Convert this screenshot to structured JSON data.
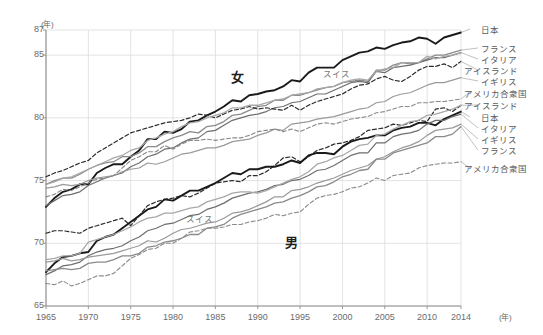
{
  "chart_data": {
    "type": "line",
    "title": "",
    "xlabel": "年",
    "ylabel": "年",
    "xlim": [
      1965,
      2014
    ],
    "ylim": [
      65,
      87
    ],
    "grid": true,
    "legend_position": "right",
    "x_ticks": [
      "1965",
      "1970",
      "1975",
      "1980",
      "1985",
      "1990",
      "1995",
      "2000",
      "2005",
      "2010",
      "2014"
    ],
    "y_ticks": [
      "87",
      "85",
      "80",
      "75",
      "70",
      "65"
    ],
    "x": [
      1965,
      1966,
      1967,
      1968,
      1969,
      1970,
      1971,
      1972,
      1973,
      1974,
      1975,
      1976,
      1977,
      1978,
      1979,
      1980,
      1981,
      1982,
      1983,
      1984,
      1985,
      1986,
      1987,
      1988,
      1989,
      1990,
      1991,
      1992,
      1993,
      1994,
      1995,
      1996,
      1997,
      1998,
      1999,
      2000,
      2001,
      2002,
      2003,
      2004,
      2005,
      2006,
      2007,
      2008,
      2009,
      2010,
      2011,
      2012,
      2013,
      2014
    ],
    "series": [
      {
        "name": "日本",
        "sex": "女",
        "style": "solid",
        "color": "#1a1a1a",
        "width": 1.9,
        "values": [
          72.9,
          73.6,
          74.1,
          74.3,
          74.7,
          74.7,
          75.6,
          76.0,
          76.3,
          76.3,
          76.9,
          77.4,
          78.3,
          78.3,
          78.9,
          78.8,
          79.1,
          79.7,
          79.8,
          80.2,
          80.5,
          80.9,
          81.4,
          81.3,
          81.8,
          81.9,
          82.1,
          82.2,
          82.5,
          83.0,
          82.9,
          83.6,
          84.0,
          84.0,
          84.0,
          84.6,
          84.9,
          85.2,
          85.3,
          85.6,
          85.5,
          85.8,
          86.0,
          86.1,
          86.4,
          86.3,
          85.9,
          86.4,
          86.6,
          86.8
        ]
      },
      {
        "name": "フランス",
        "sex": "女",
        "style": "solid",
        "color": "#8a8a8a",
        "width": 1.3,
        "values": [
          74.7,
          75.0,
          75.2,
          75.2,
          75.5,
          75.9,
          76.2,
          76.4,
          76.5,
          76.9,
          76.9,
          77.2,
          77.7,
          77.7,
          78.1,
          78.4,
          78.6,
          78.9,
          78.8,
          79.3,
          79.4,
          79.7,
          80.2,
          80.3,
          80.6,
          80.9,
          81.0,
          81.4,
          81.4,
          81.8,
          81.8,
          82.0,
          82.2,
          82.4,
          82.5,
          82.8,
          82.9,
          83.0,
          82.9,
          83.8,
          83.8,
          84.2,
          84.4,
          84.3,
          84.4,
          84.7,
          85.0,
          85.0,
          85.2,
          85.4
        ]
      },
      {
        "name": "イタリア",
        "sex": "女",
        "style": "solid",
        "color": "#6e6e6e",
        "width": 1.2,
        "values": [
          73.0,
          73.4,
          73.8,
          73.9,
          74.1,
          74.6,
          74.9,
          75.2,
          75.4,
          75.6,
          76.1,
          76.4,
          76.9,
          77.1,
          77.5,
          77.6,
          78.0,
          78.3,
          78.4,
          78.9,
          79.0,
          79.4,
          79.8,
          80.0,
          80.2,
          80.3,
          80.5,
          80.8,
          80.9,
          81.2,
          81.3,
          81.6,
          81.9,
          81.9,
          82.2,
          82.5,
          82.8,
          82.9,
          82.8,
          83.7,
          83.6,
          84.0,
          84.1,
          84.2,
          84.4,
          84.6,
          84.8,
          84.8,
          85.0,
          85.2
        ]
      },
      {
        "name": "アイスランド",
        "sex": "女",
        "style": "dashed",
        "color": "#2b2b2b",
        "width": 1.2,
        "values": [
          75.3,
          75.6,
          75.8,
          76.1,
          76.4,
          76.6,
          77.2,
          77.6,
          78.0,
          78.4,
          78.8,
          79.0,
          79.2,
          79.4,
          79.6,
          79.7,
          79.8,
          80.0,
          80.3,
          80.2,
          80.0,
          80.3,
          80.6,
          80.7,
          80.9,
          80.7,
          80.8,
          80.7,
          80.6,
          81.0,
          80.6,
          81.0,
          81.3,
          81.5,
          81.7,
          81.9,
          82.3,
          82.6,
          82.7,
          83.1,
          83.3,
          83.0,
          82.9,
          83.3,
          83.8,
          84.1,
          84.1,
          84.3,
          84.0,
          84.5
        ]
      },
      {
        "name": "イギリス",
        "sex": "女",
        "style": "solid",
        "color": "#9a9a9a",
        "width": 1.2,
        "values": [
          74.4,
          74.5,
          74.7,
          74.6,
          74.7,
          75.0,
          75.2,
          75.3,
          75.4,
          75.7,
          75.9,
          76.0,
          76.4,
          76.3,
          76.5,
          76.8,
          77.1,
          77.2,
          77.4,
          77.6,
          77.6,
          77.8,
          78.1,
          78.2,
          78.3,
          78.6,
          78.8,
          79.1,
          79.0,
          79.5,
          79.6,
          79.7,
          79.9,
          80.0,
          80.1,
          80.3,
          80.5,
          80.7,
          80.8,
          81.2,
          81.3,
          81.7,
          81.9,
          82.0,
          82.3,
          82.6,
          82.8,
          82.8,
          83.0,
          83.2
        ]
      },
      {
        "name": "アメリカ合衆国",
        "sex": "女",
        "style": "dashed",
        "color": "#8a8a8a",
        "width": 1.1,
        "values": [
          73.7,
          73.9,
          74.3,
          74.2,
          74.5,
          74.8,
          75.1,
          75.2,
          75.4,
          76.0,
          76.6,
          76.9,
          77.3,
          77.3,
          77.8,
          77.5,
          77.9,
          78.2,
          78.2,
          78.3,
          78.2,
          78.3,
          78.4,
          78.4,
          78.6,
          78.9,
          79.0,
          79.1,
          78.9,
          79.1,
          78.9,
          79.2,
          79.5,
          79.6,
          79.5,
          79.7,
          79.9,
          80.0,
          80.1,
          80.4,
          80.5,
          80.7,
          80.9,
          80.9,
          81.2,
          81.2,
          81.3,
          81.3,
          81.4,
          81.5
        ]
      },
      {
        "name": "スイス",
        "sex": "女",
        "style": "solid",
        "color": "#a8a8a8",
        "width": 1.3,
        "values": [
          74.7,
          74.9,
          75.2,
          75.3,
          75.6,
          75.9,
          76.2,
          76.5,
          76.8,
          77.0,
          77.4,
          77.6,
          78.2,
          78.4,
          78.7,
          78.9,
          79.3,
          79.6,
          79.7,
          80.0,
          80.2,
          80.4,
          80.8,
          80.8,
          81.0,
          81.0,
          81.2,
          81.4,
          81.5,
          81.8,
          81.9,
          82.0,
          82.3,
          82.4,
          82.5,
          82.8,
          83.0,
          83.1,
          83.0,
          83.7,
          83.9,
          84.0,
          84.4,
          84.4,
          84.4,
          84.9,
          84.7,
          84.9,
          85.0,
          85.2
        ]
      },
      {
        "name": "アイスランド",
        "sex": "男",
        "style": "dashed",
        "color": "#2b2b2b",
        "width": 1.2,
        "values": [
          70.8,
          71.0,
          71.0,
          70.9,
          70.8,
          71.2,
          71.4,
          71.6,
          71.8,
          72.0,
          71.4,
          72.2,
          73.0,
          73.3,
          73.5,
          73.6,
          73.8,
          73.7,
          74.0,
          74.4,
          74.8,
          74.9,
          75.0,
          74.9,
          75.4,
          75.4,
          75.7,
          76.2,
          76.8,
          76.9,
          76.5,
          76.9,
          77.4,
          77.6,
          77.9,
          78.0,
          78.2,
          78.5,
          79.0,
          79.1,
          79.2,
          79.5,
          79.4,
          79.6,
          79.8,
          79.7,
          80.7,
          80.8,
          80.5,
          81.0
        ]
      },
      {
        "name": "日本",
        "sex": "男",
        "style": "solid",
        "color": "#1a1a1a",
        "width": 1.9,
        "values": [
          67.7,
          68.4,
          68.9,
          69.0,
          69.2,
          69.3,
          70.2,
          70.5,
          70.7,
          71.2,
          71.7,
          72.2,
          72.7,
          72.9,
          73.5,
          73.4,
          73.8,
          74.2,
          74.2,
          74.5,
          74.8,
          75.2,
          75.6,
          75.5,
          75.9,
          75.9,
          76.1,
          76.1,
          76.3,
          76.6,
          76.4,
          77.0,
          77.2,
          77.2,
          77.1,
          77.7,
          78.1,
          78.3,
          78.4,
          78.6,
          78.6,
          79.0,
          79.2,
          79.3,
          79.6,
          79.6,
          79.4,
          79.9,
          80.2,
          80.5
        ]
      },
      {
        "name": "イタリア",
        "sex": "男",
        "style": "solid",
        "color": "#6e6e6e",
        "width": 1.2,
        "values": [
          67.5,
          67.8,
          68.2,
          68.3,
          68.5,
          69.0,
          69.3,
          69.5,
          69.6,
          69.8,
          70.2,
          70.5,
          71.0,
          71.2,
          71.5,
          71.6,
          71.9,
          72.2,
          72.3,
          72.7,
          72.9,
          73.2,
          73.6,
          73.8,
          74.0,
          74.1,
          74.3,
          74.6,
          74.7,
          75.0,
          75.1,
          75.4,
          75.8,
          75.9,
          76.2,
          76.6,
          77.0,
          77.2,
          77.2,
          78.0,
          78.0,
          78.5,
          78.7,
          78.8,
          79.0,
          79.5,
          79.8,
          79.8,
          80.1,
          80.3
        ]
      },
      {
        "name": "イギリス",
        "sex": "男",
        "style": "solid",
        "color": "#9a9a9a",
        "width": 1.2,
        "values": [
          68.5,
          68.6,
          68.8,
          68.6,
          68.7,
          68.9,
          69.0,
          69.1,
          69.2,
          69.4,
          69.6,
          69.8,
          70.2,
          70.1,
          70.4,
          70.8,
          71.1,
          71.2,
          71.4,
          71.6,
          71.7,
          72.0,
          72.4,
          72.5,
          72.7,
          73.0,
          73.3,
          73.7,
          73.7,
          74.2,
          74.3,
          74.5,
          74.8,
          75.0,
          75.2,
          75.5,
          75.8,
          76.0,
          76.2,
          76.7,
          76.9,
          77.3,
          77.6,
          77.8,
          78.1,
          78.6,
          79.0,
          79.1,
          79.2,
          79.5
        ]
      },
      {
        "name": "フランス",
        "sex": "男",
        "style": "solid",
        "color": "#8a8a8a",
        "width": 1.3,
        "values": [
          67.8,
          67.9,
          68.0,
          67.9,
          68.0,
          68.4,
          68.5,
          68.5,
          68.7,
          69.0,
          69.0,
          69.2,
          69.7,
          69.8,
          70.1,
          70.2,
          70.4,
          70.7,
          70.7,
          71.2,
          71.3,
          71.5,
          72.0,
          72.3,
          72.5,
          72.7,
          72.9,
          73.2,
          73.3,
          73.6,
          73.8,
          74.1,
          74.5,
          74.6,
          74.9,
          75.3,
          75.5,
          75.8,
          75.9,
          76.7,
          76.7,
          77.2,
          77.4,
          77.6,
          77.8,
          78.0,
          78.5,
          78.5,
          78.7,
          79.3
        ]
      },
      {
        "name": "アメリカ合衆国",
        "sex": "男",
        "style": "dashed",
        "color": "#8a8a8a",
        "width": 1.1,
        "values": [
          66.8,
          66.7,
          67.0,
          66.6,
          66.8,
          67.1,
          67.4,
          67.4,
          67.6,
          68.2,
          68.8,
          69.1,
          69.5,
          69.6,
          70.0,
          70.0,
          70.4,
          70.9,
          71.0,
          71.2,
          71.2,
          71.3,
          71.5,
          71.5,
          71.7,
          71.8,
          72.0,
          72.3,
          72.2,
          72.4,
          72.5,
          73.1,
          73.6,
          73.8,
          73.9,
          74.1,
          74.4,
          74.5,
          74.8,
          75.2,
          75.0,
          75.4,
          75.5,
          75.6,
          76.0,
          76.2,
          76.3,
          76.4,
          76.4,
          76.5
        ]
      },
      {
        "name": "スイス",
        "sex": "男",
        "style": "solid",
        "color": "#a8a8a8",
        "width": 1.3,
        "values": [
          68.7,
          68.8,
          69.0,
          69.0,
          69.2,
          70.1,
          70.3,
          70.5,
          70.7,
          71.0,
          71.3,
          71.7,
          72.0,
          72.1,
          72.4,
          72.4,
          72.6,
          72.8,
          72.9,
          73.3,
          73.5,
          73.7,
          74.0,
          74.1,
          74.1,
          74.0,
          74.2,
          74.5,
          74.8,
          75.1,
          75.3,
          75.7,
          76.3,
          76.5,
          76.8,
          77.0,
          77.4,
          77.8,
          77.9,
          78.6,
          78.7,
          79.1,
          79.4,
          79.7,
          79.8,
          80.2,
          80.3,
          80.5,
          80.7,
          81.0
        ]
      }
    ],
    "annotations": [
      {
        "text": "女",
        "x_px": 231,
        "y_px": 67,
        "kind": "group-label-female"
      },
      {
        "text": "男",
        "x_px": 285,
        "y_px": 232,
        "kind": "group-label-male"
      },
      {
        "text": "スイス",
        "x_px": 323,
        "y_px": 67,
        "kind": "inline-female-switzerland"
      },
      {
        "text": "スイス",
        "x_px": 186,
        "y_px": 212,
        "kind": "inline-male-switzerland"
      }
    ],
    "legend_female": [
      {
        "label": "日本",
        "y_px": 28,
        "style": "solid",
        "color": "#1a1a1a",
        "width": 2.0
      },
      {
        "label": "フランス",
        "y_px": 47,
        "style": "solid",
        "color": "#8a8a8a",
        "width": 1.3
      },
      {
        "label": "イタリア",
        "y_px": 58,
        "style": "solid",
        "color": "#6e6e6e",
        "width": 1.2
      },
      {
        "label": "アイスランド",
        "y_px": 69,
        "style": "dashed",
        "color": "#2b2b2b",
        "width": 1.2
      },
      {
        "label": "イギリス",
        "y_px": 80,
        "style": "solid",
        "color": "#9a9a9a",
        "width": 1.2
      },
      {
        "label": "アメリカ合衆国",
        "y_px": 92,
        "style": "dashed",
        "color": "#8a8a8a",
        "width": 1.1
      }
    ],
    "legend_male": [
      {
        "label": "アイスランド",
        "y_px": 104,
        "style": "dashed",
        "color": "#2b2b2b",
        "width": 1.2
      },
      {
        "label": "日本",
        "y_px": 116,
        "style": "solid",
        "color": "#1a1a1a",
        "width": 2.0
      },
      {
        "label": "イタリア",
        "y_px": 127,
        "style": "solid",
        "color": "#6e6e6e",
        "width": 1.2
      },
      {
        "label": "イギリス",
        "y_px": 138,
        "style": "solid",
        "color": "#9a9a9a",
        "width": 1.2
      },
      {
        "label": "フランス",
        "y_px": 149,
        "style": "solid",
        "color": "#8a8a8a",
        "width": 1.3
      },
      {
        "label": "アメリカ合衆国",
        "y_px": 167,
        "style": "dashed",
        "color": "#8a8a8a",
        "width": 1.1
      }
    ]
  }
}
